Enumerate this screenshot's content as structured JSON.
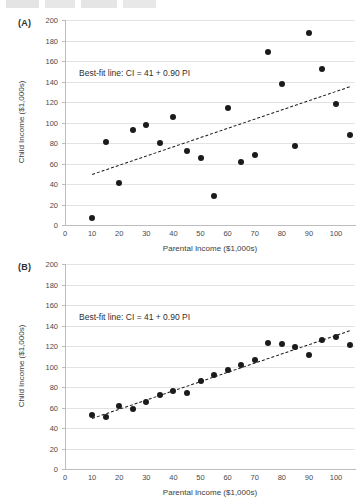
{
  "figure": {
    "cropped_header_text": "",
    "panels": [
      {
        "tag": "(A)",
        "annotation": "Best-fit line: CI = 41 + 0.90 PI"
      },
      {
        "tag": "(B)",
        "annotation": "Best-fit line: CI = 41 + 0.90 PI"
      }
    ]
  },
  "chart_data": [
    {
      "type": "scatter",
      "panel": "(A)",
      "title": "",
      "xlabel": "Parental Income ($1,000s)",
      "ylabel": "Child Income ($1,000s)",
      "xlim": [
        0,
        107
      ],
      "ylim": [
        0,
        200
      ],
      "xticks": [
        0,
        10,
        20,
        30,
        40,
        50,
        60,
        70,
        80,
        90,
        100
      ],
      "yticks": [
        0,
        20,
        40,
        60,
        80,
        100,
        120,
        140,
        160,
        180,
        200
      ],
      "grid": "horizontal",
      "legend": "none",
      "annotation": "Best-fit line: CI = 41 + 0.90 PI",
      "fit_line": {
        "intercept": 41,
        "slope": 0.9,
        "x_start": 10,
        "x_end": 105,
        "style": "dashed"
      },
      "points": [
        {
          "x": 10,
          "y": 7
        },
        {
          "x": 15,
          "y": 81
        },
        {
          "x": 20,
          "y": 41
        },
        {
          "x": 25,
          "y": 93
        },
        {
          "x": 30,
          "y": 98
        },
        {
          "x": 35,
          "y": 80
        },
        {
          "x": 40,
          "y": 105
        },
        {
          "x": 45,
          "y": 72
        },
        {
          "x": 50,
          "y": 65
        },
        {
          "x": 55,
          "y": 28
        },
        {
          "x": 60,
          "y": 114
        },
        {
          "x": 65,
          "y": 61
        },
        {
          "x": 70,
          "y": 68
        },
        {
          "x": 75,
          "y": 169
        },
        {
          "x": 80,
          "y": 138
        },
        {
          "x": 85,
          "y": 77
        },
        {
          "x": 90,
          "y": 187
        },
        {
          "x": 95,
          "y": 152
        },
        {
          "x": 100,
          "y": 118
        },
        {
          "x": 105,
          "y": 88
        }
      ]
    },
    {
      "type": "scatter",
      "panel": "(B)",
      "title": "",
      "xlabel": "Parental Income ($1,000s)",
      "ylabel": "Child Income ($1,000s)",
      "xlim": [
        0,
        107
      ],
      "ylim": [
        0,
        200
      ],
      "xticks": [
        0,
        10,
        20,
        30,
        40,
        50,
        60,
        70,
        80,
        90,
        100
      ],
      "yticks": [
        0,
        20,
        40,
        60,
        80,
        100,
        120,
        140,
        160,
        180,
        200
      ],
      "grid": "horizontal",
      "legend": "none",
      "annotation": "Best-fit line: CI = 41 + 0.90 PI",
      "fit_line": {
        "intercept": 41,
        "slope": 0.9,
        "x_start": 10,
        "x_end": 105,
        "style": "dashed"
      },
      "points": [
        {
          "x": 10,
          "y": 53
        },
        {
          "x": 15,
          "y": 51
        },
        {
          "x": 20,
          "y": 61
        },
        {
          "x": 25,
          "y": 59
        },
        {
          "x": 30,
          "y": 65
        },
        {
          "x": 35,
          "y": 72
        },
        {
          "x": 40,
          "y": 76
        },
        {
          "x": 45,
          "y": 74
        },
        {
          "x": 50,
          "y": 86
        },
        {
          "x": 55,
          "y": 92
        },
        {
          "x": 60,
          "y": 97
        },
        {
          "x": 65,
          "y": 101
        },
        {
          "x": 70,
          "y": 106
        },
        {
          "x": 75,
          "y": 123
        },
        {
          "x": 80,
          "y": 122
        },
        {
          "x": 85,
          "y": 119
        },
        {
          "x": 90,
          "y": 111
        },
        {
          "x": 95,
          "y": 126
        },
        {
          "x": 100,
          "y": 129
        },
        {
          "x": 105,
          "y": 121
        }
      ]
    }
  ]
}
